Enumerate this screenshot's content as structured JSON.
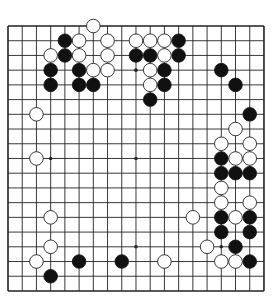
{
  "header": {
    "caption": ""
  },
  "board": {
    "size": 19,
    "origin_x": 8,
    "origin_y": 26,
    "spacing_x": 14.22,
    "spacing_y": 14.72,
    "stone_radius": 6.8,
    "colors": {
      "background": "#ffffff",
      "line": "#222222",
      "black_stone": "#111111",
      "white_stone": "#ffffff",
      "white_stone_outline": "#222222"
    },
    "star_points": [
      [
        3,
        3
      ],
      [
        9,
        3
      ],
      [
        15,
        3
      ],
      [
        3,
        9
      ],
      [
        9,
        9
      ],
      [
        15,
        9
      ],
      [
        3,
        15
      ],
      [
        9,
        15
      ],
      [
        15,
        15
      ]
    ],
    "black_stones": [
      [
        4,
        1
      ],
      [
        12,
        1
      ],
      [
        4,
        2
      ],
      [
        9,
        2
      ],
      [
        10,
        2
      ],
      [
        12,
        2
      ],
      [
        3,
        3
      ],
      [
        5,
        3
      ],
      [
        11,
        3
      ],
      [
        15,
        3
      ],
      [
        3,
        4
      ],
      [
        5,
        4
      ],
      [
        6,
        4
      ],
      [
        11,
        4
      ],
      [
        16,
        4
      ],
      [
        10,
        5
      ],
      [
        17,
        6
      ],
      [
        15,
        9
      ],
      [
        15,
        10
      ],
      [
        16,
        10
      ],
      [
        17,
        10
      ],
      [
        15,
        13
      ],
      [
        17,
        13
      ],
      [
        15,
        14
      ],
      [
        17,
        14
      ],
      [
        16,
        15
      ],
      [
        5,
        16
      ],
      [
        8,
        16
      ],
      [
        17,
        16
      ],
      [
        3,
        17
      ]
    ],
    "white_stones": [
      [
        6,
        0
      ],
      [
        5,
        1
      ],
      [
        7,
        1
      ],
      [
        9,
        1
      ],
      [
        10,
        1
      ],
      [
        11,
        1
      ],
      [
        3,
        2
      ],
      [
        5,
        2
      ],
      [
        7,
        2
      ],
      [
        11,
        2
      ],
      [
        6,
        3
      ],
      [
        7,
        3
      ],
      [
        10,
        3
      ],
      [
        10,
        4
      ],
      [
        2,
        6
      ],
      [
        16,
        7
      ],
      [
        15,
        8
      ],
      [
        17,
        8
      ],
      [
        2,
        9
      ],
      [
        16,
        9
      ],
      [
        17,
        9
      ],
      [
        15,
        11
      ],
      [
        15,
        12
      ],
      [
        17,
        12
      ],
      [
        3,
        13
      ],
      [
        13,
        13
      ],
      [
        16,
        13
      ],
      [
        3,
        15
      ],
      [
        14,
        15
      ],
      [
        2,
        16
      ],
      [
        11,
        16
      ],
      [
        15,
        16
      ],
      [
        16,
        16
      ]
    ]
  }
}
